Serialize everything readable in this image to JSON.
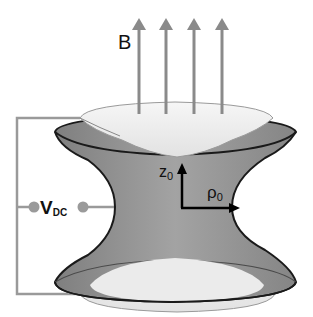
{
  "diagram": {
    "type": "Penning trap schematic",
    "labels": {
      "magnetic_field": "B",
      "voltage_main": "V",
      "voltage_sub": "DC",
      "axial_main": "z",
      "axial_sub": "0",
      "radial_main": "ρ",
      "radial_sub": "0"
    },
    "components": [
      {
        "name": "magnetic-field-arrows",
        "count": 4,
        "color": "#8a8a8a"
      },
      {
        "name": "upper-endcap-electrode",
        "color": "#ececec"
      },
      {
        "name": "ring-electrode",
        "color": "#8f8f8f"
      },
      {
        "name": "lower-endcap-electrode",
        "color": "#ececec"
      },
      {
        "name": "dc-voltage-source",
        "terminals": 2
      }
    ],
    "colors": {
      "ring_fill": "#8f8f8f",
      "endcap_fill": "#ececec",
      "outline": "#1a1a1a",
      "wire": "#9a9a9a",
      "arrow": "#8a8a8a"
    }
  }
}
